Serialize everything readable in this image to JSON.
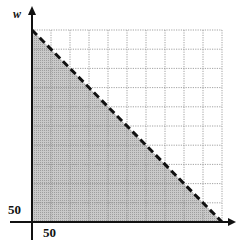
{
  "chart_data": {
    "type": "area",
    "title": "",
    "xlabel": "",
    "ylabel": "w",
    "xlim": [
      0,
      500
    ],
    "ylim": [
      0,
      500
    ],
    "grid": true,
    "grid_step": 50,
    "tick_labels": {
      "x": [
        "50"
      ],
      "y": [
        "50"
      ]
    },
    "series": [
      {
        "name": "boundary",
        "style": "dashed",
        "x": [
          0,
          500
        ],
        "y": [
          500,
          0
        ],
        "equation": "x + w = 500"
      }
    ],
    "shaded_region": {
      "description": "feasible region below the line, x >= 0, w >= 0",
      "vertices": [
        [
          0,
          0
        ],
        [
          0,
          500
        ],
        [
          500,
          0
        ]
      ],
      "fill": "#bdbdbd"
    }
  },
  "labels": {
    "y_axis": "w",
    "y_tick": "50",
    "x_tick": "50"
  },
  "colors": {
    "axis": "#111111",
    "grid": "#8a8a8a",
    "shade": "#bdbdbd",
    "line": "#111111"
  }
}
